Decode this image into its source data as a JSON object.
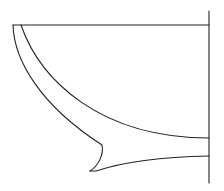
{
  "figure": {
    "type": "vessel-profile-section",
    "stroke_color": "#222222",
    "background": "#ffffff",
    "elements": [
      {
        "name": "rim-line",
        "description": "horizontal rim line"
      },
      {
        "name": "center-axis",
        "description": "vertical center axis"
      },
      {
        "name": "outer-profile",
        "description": "outer wall curve with foot"
      },
      {
        "name": "inner-profile",
        "description": "inner wall curve"
      },
      {
        "name": "base-line",
        "description": "underside of base"
      }
    ]
  }
}
